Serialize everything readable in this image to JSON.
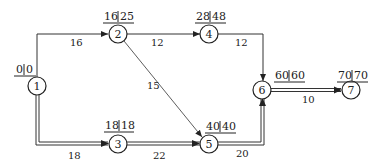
{
  "diagram": {
    "type": "activity network (critical path)",
    "nodes": [
      {
        "id": "1",
        "label": "1",
        "x": 37,
        "y": 86,
        "early": "0",
        "late": "0"
      },
      {
        "id": "2",
        "label": "2",
        "x": 118,
        "y": 34,
        "early": "16",
        "late": "25"
      },
      {
        "id": "3",
        "label": "3",
        "x": 118,
        "y": 144,
        "early": "18",
        "late": "18"
      },
      {
        "id": "4",
        "label": "4",
        "x": 209,
        "y": 34,
        "early": "28",
        "late": "48"
      },
      {
        "id": "5",
        "label": "5",
        "x": 209,
        "y": 144,
        "early": "40",
        "late": "40"
      },
      {
        "id": "6",
        "label": "6",
        "x": 262,
        "y": 90,
        "early": "60",
        "late": "60"
      },
      {
        "id": "7",
        "label": "7",
        "x": 351,
        "y": 90,
        "early": "70",
        "late": "70"
      }
    ],
    "edges": [
      {
        "from": "1",
        "to": "2",
        "duration": "16",
        "critical": false
      },
      {
        "from": "1",
        "to": "3",
        "duration": "18",
        "critical": true
      },
      {
        "from": "2",
        "to": "4",
        "duration": "12",
        "critical": false
      },
      {
        "from": "2",
        "to": "5",
        "duration": "15",
        "critical": false
      },
      {
        "from": "3",
        "to": "5",
        "duration": "22",
        "critical": true
      },
      {
        "from": "4",
        "to": "6",
        "duration": "12",
        "critical": false
      },
      {
        "from": "5",
        "to": "6",
        "duration": "20",
        "critical": true
      },
      {
        "from": "6",
        "to": "7",
        "duration": "10",
        "critical": true
      }
    ]
  }
}
